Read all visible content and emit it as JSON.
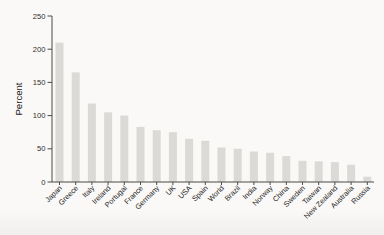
{
  "chart_data": {
    "type": "bar",
    "title": "",
    "xlabel": "",
    "ylabel": "Percent",
    "categories": [
      "Japan",
      "Greece",
      "Italy",
      "Ireland",
      "Portugal",
      "France",
      "Germany",
      "UK",
      "USA",
      "Spain",
      "World",
      "Brazil",
      "India",
      "Norway",
      "China",
      "Sweden",
      "Taiwan",
      "New Zealand",
      "Australia",
      "Russia"
    ],
    "values": [
      210,
      165,
      118,
      105,
      100,
      83,
      78,
      75,
      65,
      62,
      52,
      50,
      46,
      44,
      39,
      32,
      31,
      30,
      26,
      8
    ],
    "ylim": [
      0,
      250
    ],
    "ytick_step": 50,
    "ytick_labels": [
      "0",
      "50",
      "100",
      "150",
      "200",
      "250"
    ],
    "grid": false,
    "legend": "none",
    "colors": {
      "bar_fill": "#dbdad6",
      "axis_line": "#4a4a48",
      "tick_text": "#2e2e2e",
      "background": "#faf9f7"
    }
  }
}
